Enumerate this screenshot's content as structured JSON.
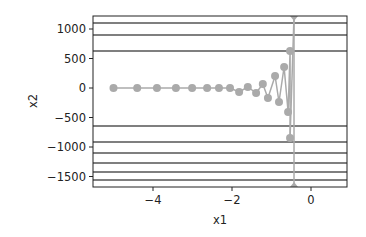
{
  "chart_data": {
    "type": "line",
    "title": "",
    "xlabel": "x1",
    "ylabel": "x2",
    "xlim": [
      -5.5,
      0.9
    ],
    "ylim": [
      -1690,
      1220
    ],
    "grid": false,
    "xticks": [
      -4,
      -2,
      0
    ],
    "xtick_labels": [
      "−4",
      "−2",
      "0"
    ],
    "yticks": [
      1000,
      500,
      0,
      -500,
      -1000,
      -1500
    ],
    "ytick_labels": [
      "1000",
      "500",
      "0",
      "−500",
      "−1000",
      "−1500"
    ],
    "contour_levels_x2": [
      1100,
      900,
      627,
      -644,
      -915,
      -1100,
      -1270,
      -1425,
      -1560
    ],
    "series": [
      {
        "name": "trajectory",
        "marker": "circle",
        "color": "#aaaaaa",
        "points": [
          {
            "x": -5.0,
            "y": 0
          },
          {
            "x": -4.4,
            "y": 0
          },
          {
            "x": -3.9,
            "y": 0
          },
          {
            "x": -3.42,
            "y": 0
          },
          {
            "x": -3.01,
            "y": 0
          },
          {
            "x": -2.63,
            "y": 0
          },
          {
            "x": -2.33,
            "y": 0
          },
          {
            "x": -2.05,
            "y": 0
          },
          {
            "x": -1.82,
            "y": -68
          },
          {
            "x": -1.6,
            "y": 17
          },
          {
            "x": -1.39,
            "y": -85
          },
          {
            "x": -1.22,
            "y": 68
          },
          {
            "x": -1.09,
            "y": -170
          },
          {
            "x": -0.91,
            "y": 203
          },
          {
            "x": -0.81,
            "y": -237
          },
          {
            "x": -0.68,
            "y": 356
          },
          {
            "x": -0.58,
            "y": -407
          },
          {
            "x": -0.53,
            "y": 627
          },
          {
            "x": -0.53,
            "y": -847
          },
          {
            "x": -0.43,
            "y": 1220
          },
          {
            "x": -0.43,
            "y": -1690
          }
        ]
      }
    ]
  },
  "colors": {
    "trajectory": "#aaaaaa",
    "contour": "#555555",
    "axis": "#222222"
  }
}
